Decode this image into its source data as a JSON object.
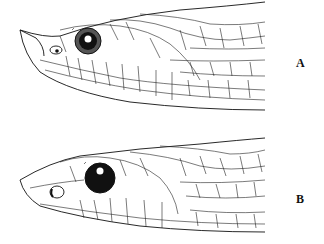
{
  "figure": {
    "panels": [
      {
        "id": "A",
        "label": "A",
        "subject": "snake head lateral view with upturned rostral scale, eye with light iris ring"
      },
      {
        "id": "B",
        "label": "B",
        "subject": "snake head lateral view with blunt snout, dark eye"
      }
    ],
    "colors": {
      "line": "#111111",
      "background": "#ffffff"
    }
  }
}
